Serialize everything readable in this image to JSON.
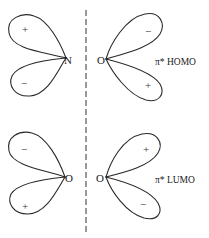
{
  "diagram": {
    "type": "molecular-orbital-lobes",
    "symmetry_axis": {
      "style": "dashed",
      "x": 86,
      "y1": 10,
      "y2": 232
    },
    "panels": [
      {
        "id": "homo",
        "label": "π* HOMO",
        "left": {
          "atom": "N",
          "upper_sign": "+",
          "lower_sign": "−"
        },
        "right": {
          "atom": "O",
          "upper_sign": "−",
          "lower_sign": "+"
        }
      },
      {
        "id": "lumo",
        "label": "π* LUMO",
        "left": {
          "atom": "O",
          "upper_sign": "−",
          "lower_sign": "+"
        },
        "right": {
          "atom": "O",
          "upper_sign": "+",
          "lower_sign": "−"
        }
      }
    ],
    "colors": {
      "stroke": "#2a2a2a",
      "background": "#ffffff"
    }
  }
}
